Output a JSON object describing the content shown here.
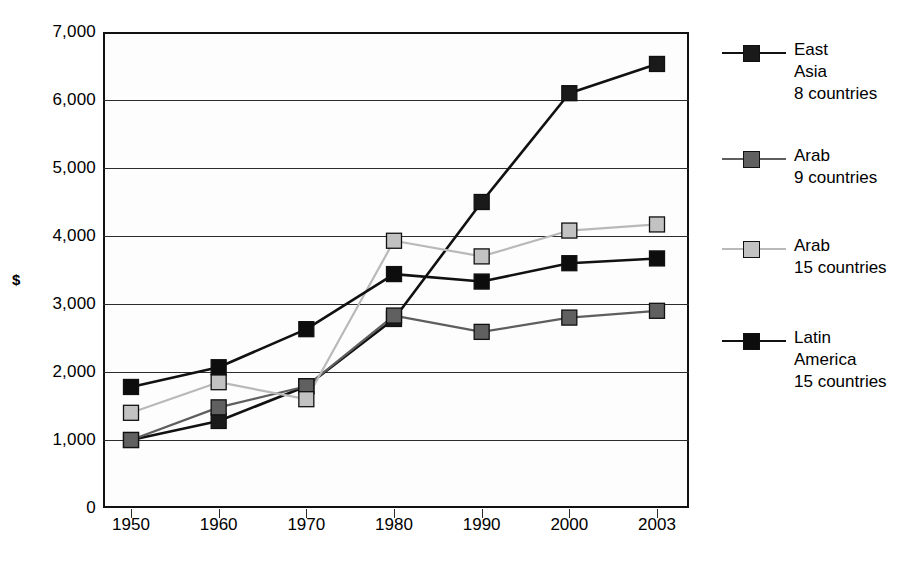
{
  "chart_data": {
    "type": "line",
    "title": "",
    "xlabel": "",
    "ylabel": "$",
    "categories": [
      "1950",
      "1960",
      "1970",
      "1980",
      "1990",
      "2000",
      "2003"
    ],
    "x": [
      1950,
      1960,
      1970,
      1980,
      1990,
      2000,
      2003
    ],
    "ylim": [
      0,
      7000
    ],
    "ytick_step": 1000,
    "yticks": [
      "7,000",
      "6,000",
      "5,000",
      "4,000",
      "3,000",
      "2,000",
      "1,000",
      "0"
    ],
    "ytick_values": [
      7000,
      6000,
      5000,
      4000,
      3000,
      2000,
      1000,
      0
    ],
    "grid": true,
    "legend_position": "right",
    "series": [
      {
        "name": "East Asia 8 countries",
        "label_lines": [
          "East",
          "Asia",
          "8 countries"
        ],
        "color": "#111111",
        "marker": "square",
        "marker_fill": "#1a1a1a",
        "line_width": 2.6,
        "values": [
          1000,
          1280,
          1790,
          2780,
          4500,
          6100,
          6530
        ]
      },
      {
        "name": "Arab 9 countries",
        "label_lines": [
          "Arab",
          "9 countries"
        ],
        "color": "#5e5e5e",
        "marker": "square",
        "marker_fill": "#606060",
        "line_width": 2.2,
        "values": [
          1000,
          1480,
          1790,
          2830,
          2590,
          2800,
          2900
        ]
      },
      {
        "name": "Arab 15 countries",
        "label_lines": [
          "Arab",
          "15 countries"
        ],
        "color": "#b9b9b9",
        "marker": "square",
        "marker_fill": "#c2c2c2",
        "line_width": 2.2,
        "values": [
          1400,
          1850,
          1600,
          3930,
          3700,
          4080,
          4170
        ]
      },
      {
        "name": "Latin America 15 countries",
        "label_lines": [
          "Latin",
          "America",
          "15 countries"
        ],
        "color": "#111111",
        "marker": "square",
        "marker_fill": "#0d0d0d",
        "line_width": 2.6,
        "values": [
          1780,
          2070,
          2630,
          3440,
          3330,
          3600,
          3670
        ]
      }
    ]
  },
  "axes": {
    "y_title": "$"
  },
  "colors": {
    "axis": "#2b2b2b",
    "frame": "#111111",
    "background": "#ffffff",
    "series_dark": "#111111",
    "series_mid_gray": "#5e5e5e",
    "series_light_gray": "#b9b9b9"
  }
}
